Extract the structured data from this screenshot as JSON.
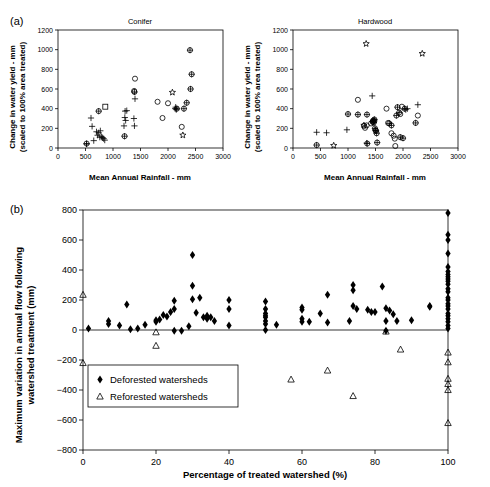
{
  "figure": {
    "panel_a_tag": "(a)",
    "panel_b_tag": "(b)"
  },
  "panel_a": {
    "subpanels": [
      {
        "title": "Conifer",
        "xlabel": "Mean Annual Rainfall - mm",
        "ylabel_line1": "Change in water yield - mm",
        "ylabel_line2": "(scaled to 100% area treated)",
        "xticks": [
          0,
          500,
          1000,
          1500,
          2000,
          2500,
          3000
        ],
        "yticks": [
          0,
          200,
          400,
          600,
          800,
          1000,
          1200
        ]
      },
      {
        "title": "Hardwood",
        "xlabel": "Mean Annual Rainfall - mm",
        "ylabel_line1": "Change in water yield - mm",
        "ylabel_line2": "(scaled to 100% area treated)",
        "xticks": [
          0,
          500,
          1000,
          1500,
          2000,
          2500,
          3000
        ],
        "yticks": [
          0,
          200,
          400,
          600,
          800,
          1000,
          1200
        ]
      }
    ]
  },
  "panel_b": {
    "xlabel": "Percentage of treated watershed (%)",
    "ylabel_line1": "Maximum variation in annual flow following",
    "ylabel_line2": "watershed treatment (mm)",
    "xticks": [
      0,
      20,
      40,
      60,
      80,
      100
    ],
    "yticks": [
      -800,
      -600,
      -400,
      -200,
      0,
      200,
      400,
      600,
      800
    ],
    "legend": [
      {
        "marker": "filled-diamond",
        "label": "Deforested watersheds"
      },
      {
        "marker": "open-triangle",
        "label": "Reforested watersheds"
      }
    ]
  },
  "chart_data": [
    {
      "type": "scatter",
      "title": "Conifer",
      "xlabel": "Mean Annual Rainfall - mm",
      "ylabel": "Change in water yield - mm (scaled to 100% area treated)",
      "xlim": [
        0,
        3000
      ],
      "ylim": [
        0,
        1200
      ],
      "grid": false,
      "legend_position": "none",
      "series": [
        {
          "name": "plus",
          "marker": "plus",
          "points": [
            [
              520,
              40
            ],
            [
              600,
              305
            ],
            [
              620,
              220
            ],
            [
              650,
              75
            ],
            [
              700,
              165
            ],
            [
              720,
              130
            ],
            [
              740,
              155
            ],
            [
              760,
              110
            ],
            [
              770,
              175
            ],
            [
              790,
              115
            ],
            [
              810,
              105
            ],
            [
              830,
              95
            ],
            [
              850,
              80
            ],
            [
              1200,
              225
            ],
            [
              1215,
              310
            ],
            [
              1220,
              375
            ],
            [
              1230,
              280
            ],
            [
              1250,
              380
            ],
            [
              1380,
              300
            ],
            [
              1390,
              225
            ],
            [
              1400,
              500
            ],
            [
              2130,
              400
            ],
            [
              2140,
              415
            ],
            [
              2150,
              390
            ]
          ]
        },
        {
          "name": "open-circle",
          "marker": "circle",
          "points": [
            [
              1400,
              705
            ],
            [
              1385,
              580
            ],
            [
              1810,
              470
            ],
            [
              1900,
              305
            ],
            [
              2000,
              455
            ],
            [
              2250,
              215
            ]
          ]
        },
        {
          "name": "crossed-circle",
          "marker": "crossed-circle",
          "points": [
            [
              520,
              45
            ],
            [
              740,
              375
            ],
            [
              1210,
              120
            ],
            [
              1390,
              570
            ],
            [
              2160,
              400
            ],
            [
              2290,
              400
            ],
            [
              2340,
              460
            ],
            [
              2400,
              995
            ],
            [
              2410,
              600
            ],
            [
              2430,
              750
            ]
          ]
        },
        {
          "name": "star",
          "marker": "star",
          "points": [
            [
              2080,
              565
            ],
            [
              2270,
              130
            ]
          ]
        },
        {
          "name": "open-square",
          "marker": "square",
          "points": [
            [
              860,
              420
            ]
          ]
        }
      ]
    },
    {
      "type": "scatter",
      "title": "Hardwood",
      "xlabel": "Mean Annual Rainfall - mm",
      "ylabel": "Change in water yield - mm (scaled to 100% area treated)",
      "xlim": [
        0,
        3000
      ],
      "ylim": [
        0,
        1200
      ],
      "grid": false,
      "legend_position": "none",
      "series": [
        {
          "name": "plus",
          "marker": "plus",
          "points": [
            [
              430,
              160
            ],
            [
              610,
              155
            ],
            [
              980,
              185
            ],
            [
              1340,
              50
            ],
            [
              1440,
              530
            ],
            [
              2050,
              390
            ],
            [
              2080,
              400
            ],
            [
              2270,
              440
            ]
          ]
        },
        {
          "name": "open-circle",
          "marker": "circle",
          "points": [
            [
              1180,
              490
            ],
            [
              1290,
              225
            ],
            [
              1310,
              205
            ],
            [
              1340,
              230
            ],
            [
              1420,
              250
            ],
            [
              1450,
              265
            ],
            [
              1480,
              275
            ],
            [
              1700,
              400
            ],
            [
              1730,
              255
            ],
            [
              1790,
              150
            ],
            [
              1830,
              125
            ],
            [
              1850,
              95
            ],
            [
              1860,
              20
            ],
            [
              1950,
              345
            ],
            [
              1980,
              420
            ],
            [
              2270,
              330
            ]
          ]
        },
        {
          "name": "crossed-circle",
          "marker": "crossed-circle",
          "points": [
            [
              430,
              30
            ],
            [
              1000,
              345
            ],
            [
              1180,
              340
            ],
            [
              1345,
              340
            ],
            [
              1350,
              45
            ],
            [
              1450,
              270
            ],
            [
              1460,
              280
            ],
            [
              1470,
              260
            ],
            [
              1480,
              290
            ],
            [
              1490,
              200
            ],
            [
              1500,
              180
            ],
            [
              1510,
              175
            ],
            [
              1520,
              150
            ],
            [
              1530,
              55
            ],
            [
              1750,
              250
            ],
            [
              1790,
              230
            ],
            [
              1880,
              330
            ],
            [
              1900,
              415
            ],
            [
              1930,
              360
            ],
            [
              1950,
              110
            ],
            [
              2000,
              100
            ],
            [
              2030,
              400
            ],
            [
              2230,
              255
            ]
          ]
        },
        {
          "name": "star",
          "marker": "star",
          "points": [
            [
              740,
              25
            ],
            [
              1330,
              1060
            ],
            [
              1290,
              230
            ],
            [
              2350,
              960
            ]
          ]
        }
      ]
    },
    {
      "type": "scatter",
      "title": "",
      "xlabel": "Percentage of treated watershed (%)",
      "ylabel": "Maximum variation in annual flow following watershed treatment (mm)",
      "xlim": [
        0,
        100
      ],
      "ylim": [
        -800,
        800
      ],
      "grid": false,
      "legend_position": "inside-lower-left",
      "series": [
        {
          "name": "Deforested watersheds",
          "marker": "filled-diamond",
          "points": [
            [
              1.5,
              10
            ],
            [
              7,
              60
            ],
            [
              7,
              40
            ],
            [
              10,
              30
            ],
            [
              12,
              170
            ],
            [
              13,
              5
            ],
            [
              15,
              10
            ],
            [
              17,
              35
            ],
            [
              20,
              65
            ],
            [
              20,
              55
            ],
            [
              21,
              70
            ],
            [
              22,
              100
            ],
            [
              23,
              90
            ],
            [
              24,
              120
            ],
            [
              25,
              195
            ],
            [
              25,
              140
            ],
            [
              25,
              -5
            ],
            [
              27,
              -5
            ],
            [
              29,
              25
            ],
            [
              30,
              500
            ],
            [
              30,
              295
            ],
            [
              30,
              205
            ],
            [
              31,
              115
            ],
            [
              32,
              215
            ],
            [
              33,
              85
            ],
            [
              34,
              95
            ],
            [
              34,
              75
            ],
            [
              35,
              85
            ],
            [
              36,
              60
            ],
            [
              40,
              200
            ],
            [
              40,
              140
            ],
            [
              40,
              30
            ],
            [
              50,
              190
            ],
            [
              50,
              140
            ],
            [
              50,
              110
            ],
            [
              50,
              95
            ],
            [
              50,
              85
            ],
            [
              50,
              60
            ],
            [
              50,
              40
            ],
            [
              50,
              0
            ],
            [
              53,
              35
            ],
            [
              60,
              150
            ],
            [
              60,
              135
            ],
            [
              60,
              75
            ],
            [
              60,
              55
            ],
            [
              62,
              55
            ],
            [
              65,
              110
            ],
            [
              67,
              235
            ],
            [
              67,
              50
            ],
            [
              73,
              60
            ],
            [
              74,
              160
            ],
            [
              74,
              300
            ],
            [
              74,
              265
            ],
            [
              75,
              140
            ],
            [
              78,
              135
            ],
            [
              79,
              120
            ],
            [
              80,
              120
            ],
            [
              82,
              290
            ],
            [
              83,
              145
            ],
            [
              83,
              60
            ],
            [
              83,
              -5
            ],
            [
              84,
              130
            ],
            [
              85,
              105
            ],
            [
              86,
              60
            ],
            [
              90,
              65
            ],
            [
              95,
              160
            ],
            [
              95,
              155
            ],
            [
              100,
              780
            ],
            [
              100,
              635
            ],
            [
              100,
              600
            ],
            [
              100,
              510
            ],
            [
              100,
              420
            ],
            [
              100,
              390
            ],
            [
              100,
              370
            ],
            [
              100,
              355
            ],
            [
              100,
              340
            ],
            [
              100,
              325
            ],
            [
              100,
              305
            ],
            [
              100,
              275
            ],
            [
              100,
              255
            ],
            [
              100,
              215
            ],
            [
              100,
              200
            ],
            [
              100,
              175
            ],
            [
              100,
              160
            ],
            [
              100,
              140
            ],
            [
              100,
              110
            ],
            [
              100,
              95
            ],
            [
              100,
              75
            ],
            [
              100,
              55
            ],
            [
              100,
              30
            ],
            [
              100,
              10
            ]
          ]
        },
        {
          "name": "Reforested watersheds",
          "marker": "open-triangle",
          "points": [
            [
              0,
              235
            ],
            [
              0,
              -220
            ],
            [
              20,
              -15
            ],
            [
              20,
              -105
            ],
            [
              57,
              -330
            ],
            [
              67,
              -270
            ],
            [
              74,
              -440
            ],
            [
              83,
              -10
            ],
            [
              87,
              -130
            ],
            [
              100,
              -150
            ],
            [
              100,
              -215
            ],
            [
              100,
              -325
            ],
            [
              100,
              -360
            ],
            [
              100,
              -400
            ],
            [
              100,
              -620
            ]
          ]
        }
      ]
    }
  ]
}
